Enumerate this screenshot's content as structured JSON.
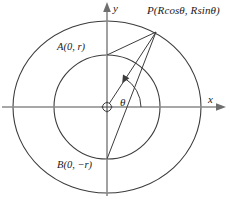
{
  "figure": {
    "type": "geometry-diagram",
    "background_color": "#ffffff",
    "stroke_color": "#3c3c3c",
    "axis_color": "#7a7a7a",
    "text_color": "#1a1a1a"
  },
  "axes": {
    "x_label": "x",
    "y_label": "y",
    "origin_marker": "crossed-circle"
  },
  "labels": {
    "point_p": "P(Rcosθ, Rsinθ)",
    "point_a": "A(0, r)",
    "point_b": "B(0, −r)",
    "angle": "θ"
  },
  "geometry": {
    "center": {
      "x": 107,
      "y": 107
    },
    "inner_circle": {
      "rx": 53,
      "ry": 52,
      "label": "r"
    },
    "outer_circle": {
      "rx": 94,
      "ry": 86,
      "label": "R"
    },
    "point_p": {
      "x": 156,
      "y": 32
    },
    "point_a": {
      "x": 107,
      "y": 55
    },
    "point_b": {
      "x": 107,
      "y": 159
    },
    "angle_arc_degrees": 57,
    "segments": [
      {
        "from": "P",
        "to": "A"
      },
      {
        "from": "P",
        "to": "O"
      },
      {
        "from": "P",
        "to": "B"
      }
    ]
  }
}
